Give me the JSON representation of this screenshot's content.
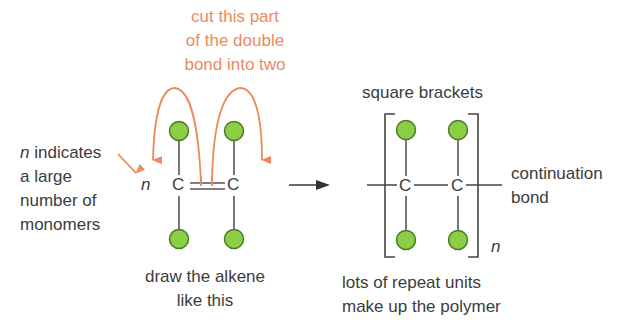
{
  "colors": {
    "annotation": "#ee8a5e",
    "text": "#3c3c3c",
    "atom_fill": "#8ccf45",
    "atom_stroke": "#4a7a2a",
    "bond": "#555555"
  },
  "annotations": {
    "cut_bond": [
      "cut this part",
      "of the double",
      "bond into two"
    ],
    "n_indicates": {
      "italic_prefix": "n",
      "line1_rest": " indicates",
      "lines": [
        "a large",
        "number of",
        "monomers"
      ]
    },
    "draw_alkene": [
      "draw the alkene",
      "like this"
    ],
    "square_brackets": "square brackets",
    "continuation_bond": [
      "continuation",
      "bond"
    ],
    "repeat_units": [
      "lots of repeat units",
      "make up the polymer"
    ]
  },
  "monomer": {
    "n_label": "n",
    "atom_left": "C",
    "atom_right": "C",
    "bond_type": "double"
  },
  "polymer": {
    "atom_left": "C",
    "atom_right": "C",
    "bond_type": "single",
    "subscript": "n"
  },
  "reaction_arrow": "right-arrow"
}
